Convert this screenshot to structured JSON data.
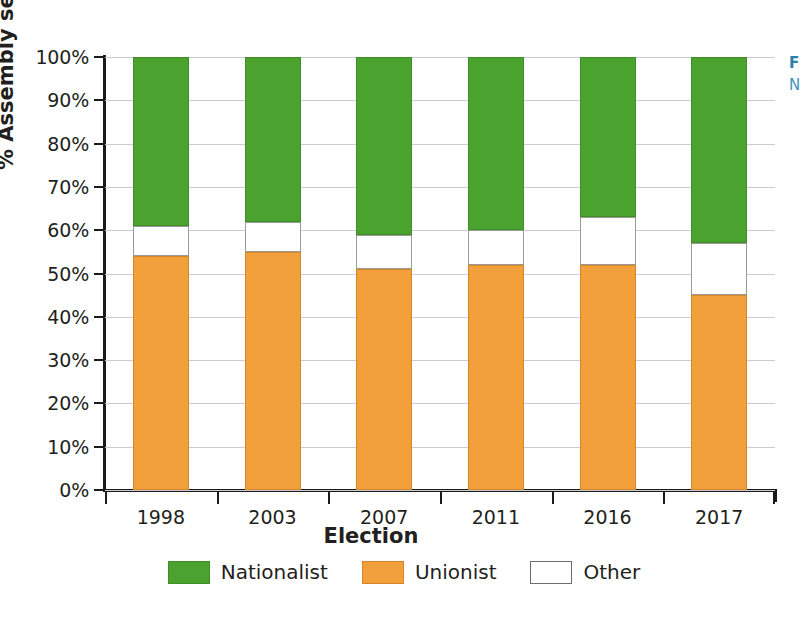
{
  "chart_data": {
    "type": "bar",
    "stacked": true,
    "normalized_percent": true,
    "title": "",
    "subtitle": "",
    "xlabel": "Election",
    "ylabel": "% Assembly seats",
    "categories": [
      "1998",
      "2003",
      "2007",
      "2011",
      "2016",
      "2017"
    ],
    "series": [
      {
        "name": "Nationalist",
        "color": "#4CA22F",
        "values": [
          39,
          38,
          41,
          40,
          37,
          43
        ]
      },
      {
        "name": "Unionist",
        "color": "#F2A03C",
        "values": [
          54,
          55,
          51,
          52,
          52,
          45
        ]
      },
      {
        "name": "Other",
        "color": "#FFFFFF",
        "values": [
          7,
          7,
          8,
          8,
          11,
          12
        ]
      }
    ],
    "stack_order_bottom_to_top": [
      "Unionist",
      "Other",
      "Nationalist"
    ],
    "segment_tops_percent": {
      "1998": {
        "unionist_top": 54,
        "other_top": 61,
        "nationalist_top": 100
      },
      "2003": {
        "unionist_top": 55,
        "other_top": 62,
        "nationalist_top": 100
      },
      "2007": {
        "unionist_top": 51,
        "other_top": 59,
        "nationalist_top": 100
      },
      "2011": {
        "unionist_top": 52,
        "other_top": 60,
        "nationalist_top": 100
      },
      "2016": {
        "unionist_top": 52,
        "other_top": 63,
        "nationalist_top": 100
      },
      "2017": {
        "unionist_top": 45,
        "other_top": 57,
        "nationalist_top": 100
      }
    },
    "ylim": [
      0,
      100
    ],
    "ytick_values": [
      0,
      10,
      20,
      30,
      40,
      50,
      60,
      70,
      80,
      90,
      100
    ],
    "ytick_labels": [
      "0%",
      "10%",
      "20%",
      "30%",
      "40%",
      "50%",
      "60%",
      "70%",
      "80%",
      "90%",
      "100%"
    ],
    "grid": "horizontal",
    "legend_position": "bottom-center",
    "legend": [
      {
        "label": "Nationalist",
        "color": "#4CA22F"
      },
      {
        "label": "Unionist",
        "color": "#F2A03C"
      },
      {
        "label": "Other",
        "color": "#FFFFFF"
      }
    ]
  },
  "axes": {
    "y_title": "% Assembly seats",
    "x_title": "Election"
  },
  "margin_note": {
    "line1": "F",
    "line2": "N"
  },
  "colors": {
    "nationalist": "#4CA22F",
    "unionist": "#F2A03C",
    "other": "#FFFFFF",
    "axis": "#1A1A1A",
    "grid": "#C9CCD1",
    "text": "#231F20",
    "note": "#2B7FA8"
  }
}
